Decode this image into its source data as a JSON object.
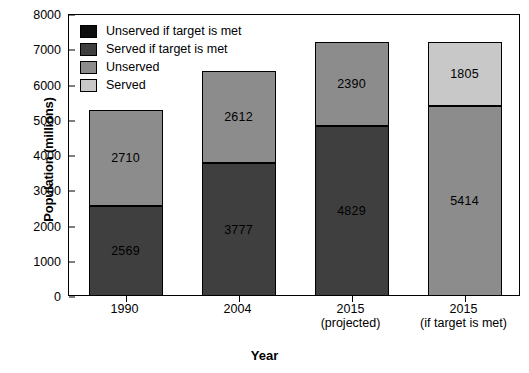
{
  "chart_data": {
    "type": "bar",
    "stacked": true,
    "title": "",
    "xlabel": "Year",
    "ylabel": "Population (millions)",
    "ylim": [
      0,
      8000
    ],
    "yticks": [
      0,
      1000,
      2000,
      3000,
      4000,
      5000,
      6000,
      7000,
      8000
    ],
    "ytick_labels": [
      "0",
      "1000",
      "2000",
      "3000",
      "4000",
      "5000",
      "6000",
      "7000",
      "8000"
    ],
    "grid": false,
    "legend_position": "top-left inside plot",
    "categories": [
      "1990",
      "2004",
      "2015",
      "2015"
    ],
    "category_sublabels": [
      "",
      "",
      "(projected)",
      "(if target is met)"
    ],
    "series": [
      {
        "name": "Unserved if target is met",
        "color": "#0d0d0d",
        "values": [
          null,
          null,
          null,
          1805
        ]
      },
      {
        "name": "Served if target is met",
        "color": "#3f3f3f",
        "values": [
          null,
          null,
          null,
          5414
        ]
      },
      {
        "name": "Unserved",
        "color": "#8c8c8c",
        "values": [
          2710,
          2612,
          2390,
          null
        ]
      },
      {
        "name": "Served",
        "color": "#c8c8c8",
        "values": [
          2569,
          3777,
          4829,
          null
        ]
      }
    ],
    "bars": [
      {
        "category": "1990",
        "sublabel": "",
        "total": 5279,
        "segments": [
          {
            "series": "Served",
            "value": 2569,
            "label": "2569",
            "color": "#3f3f3f",
            "label_color": "#000000"
          },
          {
            "series": "Unserved",
            "value": 2710,
            "label": "2710",
            "color": "#8c8c8c",
            "label_color": "#000000"
          }
        ]
      },
      {
        "category": "2004",
        "sublabel": "",
        "total": 6389,
        "segments": [
          {
            "series": "Served",
            "value": 3777,
            "label": "3777",
            "color": "#3f3f3f",
            "label_color": "#000000"
          },
          {
            "series": "Unserved",
            "value": 2612,
            "label": "2612",
            "color": "#8c8c8c",
            "label_color": "#000000"
          }
        ]
      },
      {
        "category": "2015",
        "sublabel": "(projected)",
        "total": 7219,
        "segments": [
          {
            "series": "Served",
            "value": 4829,
            "label": "4829",
            "color": "#3f3f3f",
            "label_color": "#000000"
          },
          {
            "series": "Unserved",
            "value": 2390,
            "label": "2390",
            "color": "#8c8c8c",
            "label_color": "#000000"
          }
        ]
      },
      {
        "category": "2015",
        "sublabel": "(if target is met)",
        "total": 7219,
        "segments": [
          {
            "series": "Served if target is met",
            "value": 5414,
            "label": "5414",
            "color": "#8c8c8c",
            "label_color": "#000000"
          },
          {
            "series": "Unserved if target is met",
            "value": 1805,
            "label": "1805",
            "color": "#c8c8c8",
            "label_color": "#000000"
          }
        ]
      }
    ]
  },
  "legend": {
    "items": [
      {
        "label": "Unserved if target is met",
        "color": "#0d0d0d"
      },
      {
        "label": "Served if target is met",
        "color": "#3f3f3f"
      },
      {
        "label": "Unserved",
        "color": "#8c8c8c"
      },
      {
        "label": "Served",
        "color": "#c8c8c8"
      }
    ]
  }
}
